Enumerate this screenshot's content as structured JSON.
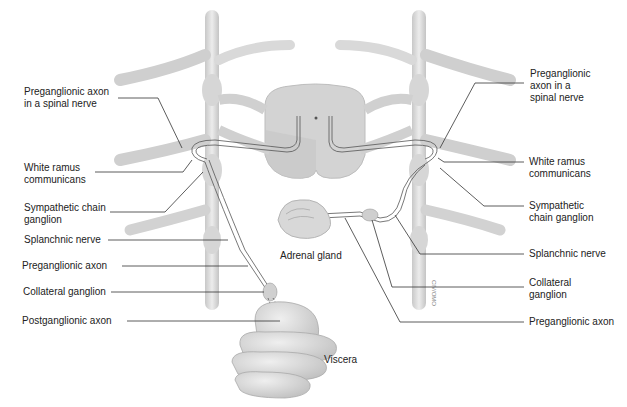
{
  "diagram": {
    "colors": {
      "background": "#ffffff",
      "structure_fill": "#d9d9d9",
      "structure_shade": "#bdbdbd",
      "leader_line": "#333333",
      "label_text": "#222222"
    },
    "left_labels": [
      {
        "id": "preganglionic-axon-spinal-nerve-left",
        "text": "Preganglionic axon\nin a spinal nerve"
      },
      {
        "id": "white-ramus-left",
        "text": "White ramus\ncommunicans"
      },
      {
        "id": "sympathetic-chain-ganglion-left",
        "text": "Sympathetic chain\nganglion"
      },
      {
        "id": "splanchnic-nerve-left",
        "text": "Splanchnic nerve"
      },
      {
        "id": "preganglionic-axon-left",
        "text": "Preganglionic axon"
      },
      {
        "id": "collateral-ganglion-left",
        "text": "Collateral ganglion"
      },
      {
        "id": "postganglionic-axon-left",
        "text": "Postganglionic axon"
      }
    ],
    "right_labels": [
      {
        "id": "preganglionic-axon-spinal-nerve-right",
        "text": "Preganglionic\naxon in a\nspinal nerve"
      },
      {
        "id": "white-ramus-right",
        "text": "White ramus\ncommunicans"
      },
      {
        "id": "sympathetic-chain-ganglion-right",
        "text": "Sympathetic\nchain ganglion"
      },
      {
        "id": "splanchnic-nerve-right",
        "text": "Splanchnic nerve"
      },
      {
        "id": "collateral-ganglion-right",
        "text": "Collateral\nganglion"
      },
      {
        "id": "preganglionic-axon-right",
        "text": "Preganglionic axon"
      }
    ],
    "inline_labels": {
      "adrenal_gland": "Adrenal gland",
      "viscera": "Viscera"
    }
  }
}
